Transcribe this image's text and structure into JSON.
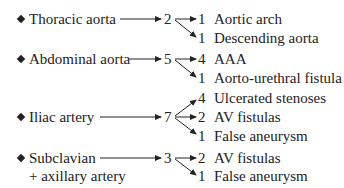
{
  "diagram": {
    "groups": [
      {
        "label": "Thoracic aorta",
        "count": "2",
        "outcomes": [
          {
            "n": "1",
            "label": "Aortic arch"
          },
          {
            "n": "1",
            "label": "Descending aorta"
          }
        ]
      },
      {
        "label": "Abdominal aorta",
        "count": "5",
        "outcomes": [
          {
            "n": "4",
            "label": "AAA"
          },
          {
            "n": "1",
            "label": "Aorto-urethral fistula"
          }
        ]
      },
      {
        "label": "Iliac artery",
        "count": "7",
        "outcomes": [
          {
            "n": "4",
            "label": "Ulcerated stenoses"
          },
          {
            "n": "2",
            "label": "AV fistulas"
          },
          {
            "n": "1",
            "label": "False aneurysm"
          }
        ]
      },
      {
        "label": "Subclavian",
        "label_line2": "+ axillary artery",
        "count": "3",
        "outcomes": [
          {
            "n": "2",
            "label": "AV fistulas"
          },
          {
            "n": "1",
            "label": "False aneurysm"
          }
        ]
      }
    ]
  }
}
